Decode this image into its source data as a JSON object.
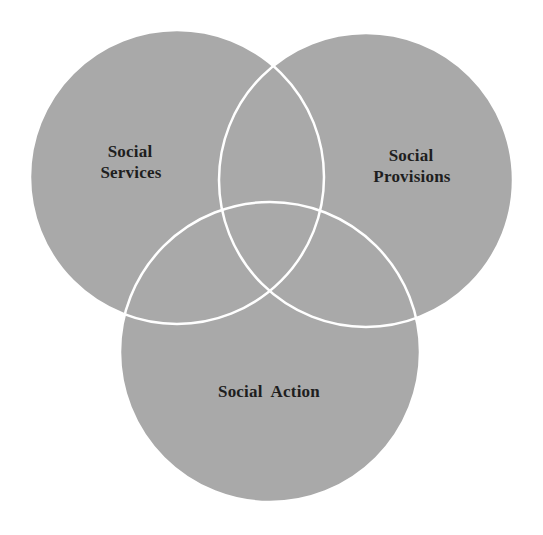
{
  "diagram": {
    "type": "venn",
    "background": "#ffffff",
    "fill_color": "#a9a9a9",
    "outline_color": "#ffffff",
    "circles": [
      {
        "id": "services",
        "label_lines": [
          "Social",
          "Services"
        ],
        "cx": 177,
        "cy": 177,
        "r": 147
      },
      {
        "id": "provisions",
        "label_lines": [
          "Social",
          "Provisions"
        ],
        "cx": 366,
        "cy": 180,
        "r": 147
      },
      {
        "id": "action",
        "label_lines": [
          "Social  Action"
        ],
        "cx": 270,
        "cy": 352,
        "r": 150
      }
    ]
  },
  "labels": {
    "services_line1": "Social",
    "services_line2": "Services",
    "provisions_line1": "Social",
    "provisions_line2": "Provisions",
    "action": "Social  Action"
  }
}
